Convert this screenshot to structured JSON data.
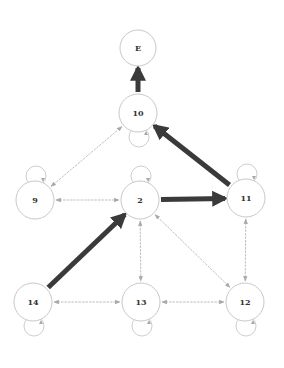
{
  "diagram": {
    "nodes": [
      {
        "id": "E",
        "label": "E",
        "x": 138,
        "y": 48,
        "r": 18,
        "self_loop": false
      },
      {
        "id": "10",
        "label": "10",
        "x": 138,
        "y": 113,
        "r": 19,
        "self_loop": true
      },
      {
        "id": "9",
        "label": "9",
        "x": 35,
        "y": 200,
        "r": 19,
        "self_loop": true
      },
      {
        "id": "2",
        "label": "2",
        "x": 140,
        "y": 200,
        "r": 19,
        "self_loop": true
      },
      {
        "id": "11",
        "label": "11",
        "x": 246,
        "y": 198,
        "r": 19,
        "self_loop": true
      },
      {
        "id": "14",
        "label": "14",
        "x": 33,
        "y": 302,
        "r": 19,
        "self_loop": true
      },
      {
        "id": "13",
        "label": "13",
        "x": 141,
        "y": 302,
        "r": 19,
        "self_loop": true
      },
      {
        "id": "12",
        "label": "12",
        "x": 245,
        "y": 302,
        "r": 19,
        "self_loop": true
      }
    ],
    "edges": [
      {
        "from": "10",
        "to": "E",
        "style": "bold",
        "bidirectional": false
      },
      {
        "from": "11",
        "to": "10",
        "style": "bold",
        "bidirectional": false
      },
      {
        "from": "2",
        "to": "11",
        "style": "bold",
        "bidirectional": false
      },
      {
        "from": "14",
        "to": "2",
        "style": "bold",
        "bidirectional": false
      },
      {
        "from": "9",
        "to": "10",
        "style": "thin",
        "bidirectional": true
      },
      {
        "from": "9",
        "to": "2",
        "style": "thin",
        "bidirectional": true
      },
      {
        "from": "2",
        "to": "13",
        "style": "thin",
        "bidirectional": true
      },
      {
        "from": "2",
        "to": "12",
        "style": "thin",
        "bidirectional": true
      },
      {
        "from": "11",
        "to": "12",
        "style": "thin",
        "bidirectional": true
      },
      {
        "from": "14",
        "to": "13",
        "style": "thin",
        "bidirectional": true
      },
      {
        "from": "13",
        "to": "12",
        "style": "thin",
        "bidirectional": true
      }
    ],
    "colors": {
      "bold_edge": "#3a3a3a",
      "thin_edge": "#b8b8b8",
      "node_stroke": "#c8c8c8",
      "label": "#333333"
    }
  }
}
